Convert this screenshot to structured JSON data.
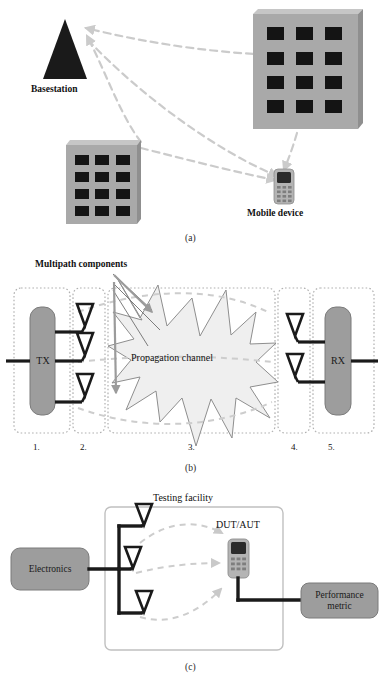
{
  "figure": {
    "panels": [
      {
        "id": "a",
        "caption": "(a)",
        "labels": {
          "basestation": "Basestation",
          "mobile_device": "Mobile device"
        },
        "elements": {
          "basestation_icon": "tower-triangle-icon",
          "building_right": "building-icon",
          "building_left": "building-icon",
          "mobile_icon": "mobile-phone-icon",
          "propagation_paths": "dashed-arrow-path"
        }
      },
      {
        "id": "b",
        "caption": "(b)",
        "labels": {
          "multipath": "Multipath components",
          "tx": "TX",
          "rx": "RX",
          "channel": "Propagation channel"
        },
        "stage_numbers": [
          "1.",
          "2.",
          "3.",
          "4.",
          "5."
        ],
        "antenna_counts": {
          "tx": 3,
          "rx": 2
        }
      },
      {
        "id": "c",
        "caption": "(c)",
        "labels": {
          "testing_facility": "Testing facility",
          "electronics": "Electronics",
          "dut_aut": "DUT/AUT",
          "performance_metric": "Performance\nmetric"
        },
        "antenna_counts": {
          "probes": 3
        }
      }
    ]
  },
  "colors": {
    "background": "#ffffff",
    "ink": "#111111",
    "block_fill": "#9d9d9d",
    "block_stroke": "#6f6f6f",
    "building_fill": "#a8a8a8",
    "building_top": "#c4c4c4",
    "window_fill": "#1a1a1a",
    "basestation_fill": "#1a1a1a",
    "dashed_gray": "#c9c9c9",
    "starburst_fill": "#efefef",
    "starburst_stroke": "#8a8a8a",
    "arrow_gray": "#9a9a9a",
    "dotted_border": "#b5b5b5",
    "facility_border": "#bdbdbd",
    "wire": "#1a1a1a",
    "phone_body": "#b0b0b0",
    "phone_screen": "#2a2a2a",
    "phone_key": "#8a8a8a"
  }
}
